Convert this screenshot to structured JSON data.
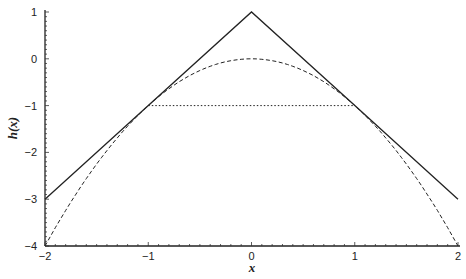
{
  "chart_data": {
    "type": "line",
    "title": "",
    "xlabel": "x",
    "ylabel": "h(x)",
    "xlim": [
      -2,
      2
    ],
    "ylim": [
      -4,
      1
    ],
    "grid": false,
    "legend": null,
    "x_ticks": [
      "-2",
      "-1",
      "0",
      "1",
      "2"
    ],
    "y_ticks": [
      "1",
      "0",
      "-1",
      "-2",
      "-3",
      "-4"
    ],
    "series": [
      {
        "name": "h(x) = 1 - |x|",
        "style": "solid",
        "x": [
          -2,
          -1,
          0,
          1,
          2
        ],
        "y": [
          -3,
          -1,
          1,
          -1,
          -3
        ]
      },
      {
        "name": "-x^2",
        "style": "dashed",
        "x": [
          -2,
          -1.5,
          -1,
          -0.5,
          0,
          0.5,
          1,
          1.5,
          2
        ],
        "y": [
          -4,
          -2.25,
          -1,
          -0.25,
          0,
          -0.25,
          -1,
          -2.25,
          -4
        ]
      },
      {
        "name": "y = -1",
        "style": "dotted",
        "x": [
          -1,
          1
        ],
        "y": [
          -1,
          -1
        ]
      }
    ]
  }
}
